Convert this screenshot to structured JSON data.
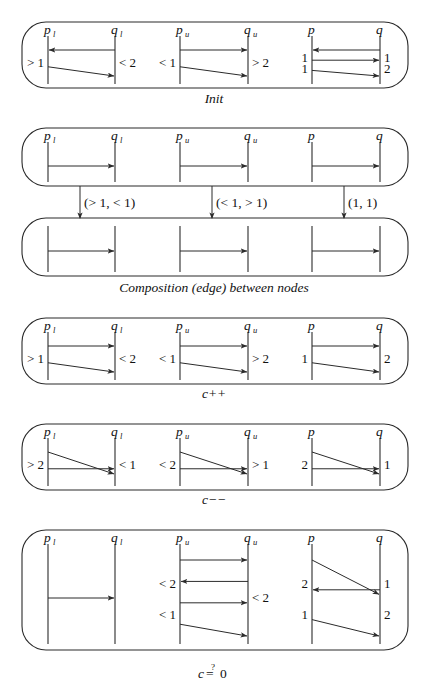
{
  "figure": {
    "stroke_color": "#2b2b2b",
    "background_color": "#ffffff",
    "text_color": "#111111"
  },
  "column_labels": {
    "p_lower": "p",
    "p_lower_sub": "l",
    "q_lower": "q",
    "q_lower_sub": "l",
    "p_upper": "p",
    "p_upper_sub": "u",
    "q_upper": "q",
    "q_upper_sub": "u",
    "p_plain": "p",
    "q_plain": "q"
  },
  "panels": [
    {
      "id": "init",
      "caption": "Init",
      "groups": [
        {
          "id": "init-pl-ql",
          "left_labels": [
            "> 1"
          ],
          "right_labels": [
            "< 2"
          ],
          "arrows": [
            "left-horizontal",
            "right-diagonal-down"
          ]
        },
        {
          "id": "init-pu-qu",
          "left_labels": [
            "< 1"
          ],
          "right_labels": [
            "> 2"
          ],
          "arrows": [
            "right-horizontal",
            "right-diagonal-down"
          ]
        },
        {
          "id": "init-p-q",
          "left_labels": [
            "1",
            "1"
          ],
          "right_labels": [
            "1",
            "2"
          ],
          "arrows": [
            "left-horizontal",
            "right-horizontal",
            "right-diagonal-down"
          ]
        }
      ]
    },
    {
      "id": "composition",
      "caption": "Composition (edge) between nodes",
      "edge_labels": [
        "(> 1, < 1)",
        "(< 1, > 1)",
        "(1, 1)"
      ],
      "top_box": {
        "groups": [
          {
            "id": "comp-top-pl-ql",
            "arrows": [
              "right-horizontal"
            ]
          },
          {
            "id": "comp-top-pu-qu",
            "arrows": [
              "right-horizontal"
            ]
          },
          {
            "id": "comp-top-p-q",
            "arrows": [
              "right-horizontal"
            ]
          }
        ]
      },
      "bottom_box": {
        "groups": [
          {
            "id": "comp-bot-pl-ql",
            "arrows": [
              "right-horizontal"
            ]
          },
          {
            "id": "comp-bot-pu-qu",
            "arrows": [
              "right-horizontal"
            ]
          },
          {
            "id": "comp-bot-p-q",
            "arrows": [
              "right-horizontal"
            ]
          }
        ]
      }
    },
    {
      "id": "c-increment",
      "caption": "c++",
      "groups": [
        {
          "id": "cpp-pl-ql",
          "left_labels": [
            "> 1"
          ],
          "right_labels": [
            "< 2"
          ],
          "arrows": [
            "right-horizontal",
            "right-diagonal-down"
          ]
        },
        {
          "id": "cpp-pu-qu",
          "left_labels": [
            "< 1"
          ],
          "right_labels": [
            "> 2"
          ],
          "arrows": [
            "right-horizontal",
            "right-diagonal-down"
          ]
        },
        {
          "id": "cpp-p-q",
          "left_labels": [
            "1"
          ],
          "right_labels": [
            "2"
          ],
          "arrows": [
            "right-horizontal",
            "right-diagonal-down"
          ]
        }
      ]
    },
    {
      "id": "c-decrement",
      "caption": "c−−",
      "groups": [
        {
          "id": "cmm-pl-ql",
          "left_labels": [
            "> 2"
          ],
          "right_labels": [
            "< 1"
          ],
          "arrows": [
            "right-diagonal-down",
            "right-horizontal"
          ]
        },
        {
          "id": "cmm-pu-qu",
          "left_labels": [
            "< 2"
          ],
          "right_labels": [
            "> 1"
          ],
          "arrows": [
            "right-diagonal-down",
            "right-horizontal"
          ]
        },
        {
          "id": "cmm-p-q",
          "left_labels": [
            "2"
          ],
          "right_labels": [
            "1"
          ],
          "arrows": [
            "right-diagonal-down",
            "right-horizontal"
          ]
        }
      ]
    },
    {
      "id": "c-equals-zero",
      "caption_c": "c",
      "caption_q": "?",
      "caption_eq": "=",
      "caption_zero": "0",
      "caption": "c ≟ 0",
      "groups": [
        {
          "id": "czero-pl-ql",
          "left_labels": [],
          "right_labels": [],
          "arrows": [
            "right-horizontal"
          ]
        },
        {
          "id": "czero-pu-qu",
          "left_labels": [
            "< 2",
            "< 1"
          ],
          "right_labels": [
            "< 2"
          ],
          "arrows": [
            "right-horizontal",
            "left-horizontal",
            "right-horizontal",
            "right-diagonal-down"
          ]
        },
        {
          "id": "czero-p-q",
          "left_labels": [
            "2",
            "1"
          ],
          "right_labels": [
            "1",
            "2"
          ],
          "arrows": [
            "right-diagonal-down",
            "left-horizontal",
            "right-diagonal-down"
          ]
        }
      ]
    }
  ]
}
